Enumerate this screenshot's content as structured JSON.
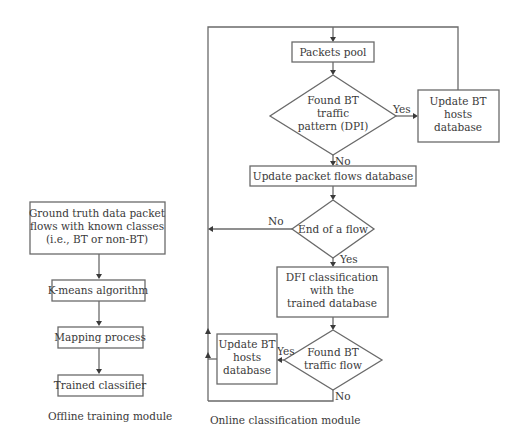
{
  "offline": {
    "caption": "Offline training module",
    "ground_truth": [
      "Ground truth data packet",
      "flows with known classes",
      "(i.e., BT or non-BT)"
    ],
    "kmeans": "K-means algorithm",
    "mapping": "Mapping process",
    "trained": "Trained classifier"
  },
  "online": {
    "caption": "Online classification module",
    "packets_pool": "Packets pool",
    "dpi_decision": [
      "Found BT",
      "traffic",
      "pattern (DPI)"
    ],
    "update_hosts_top": [
      "Update BT",
      "hosts",
      "database"
    ],
    "update_flows": "Update packet flows database",
    "end_flow": "End of a flow",
    "dfi": [
      "DFI classification",
      "with the",
      "trained database"
    ],
    "flow_decision": [
      "Found BT",
      "traffic flow"
    ],
    "update_hosts_bottom": [
      "Update BT",
      "hosts",
      "database"
    ],
    "labels": {
      "dpi_yes": "Yes",
      "dpi_no": "No",
      "end_no": "No",
      "end_yes": "Yes",
      "flow_yes": "Yes",
      "flow_no": "No"
    }
  },
  "colors": {
    "line": "#6a6a6a",
    "text": "#3a3a3a",
    "background": "#ffffff"
  }
}
